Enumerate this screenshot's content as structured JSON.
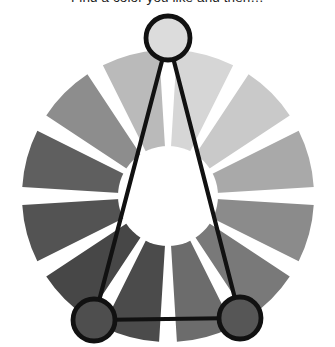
{
  "caption": {
    "text": "Find a color you like and then…"
  },
  "widget": {
    "name": "color-wheel-triad-selector",
    "segment_count": 12,
    "gap_color": "#ffffff",
    "hub_color": "#ffffff",
    "center": {
      "x": 168,
      "y": 196
    },
    "outer_radius": 146,
    "inner_radius": 48,
    "gap_degrees": 7,
    "overlay": {
      "type": "triad-triangle",
      "stroke_color": "#111111",
      "stroke_width": 4.2,
      "marker_fill_stroke": "#111111",
      "markers": [
        {
          "name": "marker-top",
          "x": 168,
          "y": 38,
          "r": 22,
          "fill": "#dcdcdc",
          "segment_index": 0
        },
        {
          "name": "marker-bottom-left",
          "x": 94,
          "y": 320,
          "r": 21,
          "fill": "#4e4e4e",
          "segment_index": 4
        },
        {
          "name": "marker-bottom-right",
          "x": 240,
          "y": 318,
          "r": 21,
          "fill": "#565656",
          "segment_index": 8
        }
      ]
    },
    "segments": [
      {
        "index": 0,
        "name": "segment-1-top",
        "start_deg": -90,
        "color": "#d6d6d6"
      },
      {
        "index": 1,
        "name": "segment-2",
        "start_deg": -60,
        "color": "#c9c9c9"
      },
      {
        "index": 2,
        "name": "segment-3",
        "start_deg": -30,
        "color": "#a9a9a9"
      },
      {
        "index": 3,
        "name": "segment-4-right",
        "start_deg": 0,
        "color": "#8b8b8b"
      },
      {
        "index": 4,
        "name": "segment-5",
        "start_deg": 30,
        "color": "#797979"
      },
      {
        "index": 5,
        "name": "segment-6",
        "start_deg": 60,
        "color": "#6c6c6c"
      },
      {
        "index": 6,
        "name": "segment-7-bottom",
        "start_deg": 90,
        "color": "#4b4b4b"
      },
      {
        "index": 7,
        "name": "segment-8",
        "start_deg": 120,
        "color": "#474747"
      },
      {
        "index": 8,
        "name": "segment-9",
        "start_deg": 150,
        "color": "#535353"
      },
      {
        "index": 9,
        "name": "segment-10-left",
        "start_deg": 180,
        "color": "#5f5f5f"
      },
      {
        "index": 10,
        "name": "segment-11",
        "start_deg": 210,
        "color": "#8d8d8d"
      },
      {
        "index": 11,
        "name": "segment-12",
        "start_deg": 240,
        "color": "#bababa"
      }
    ]
  }
}
